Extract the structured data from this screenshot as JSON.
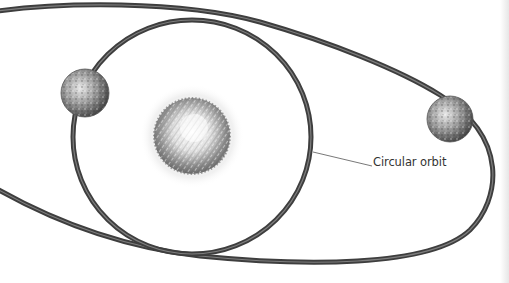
{
  "diagram": {
    "labels": {
      "circular_orbit": "Circular orbit"
    },
    "elements": [
      {
        "type": "star",
        "name": "central-star",
        "cx": 192,
        "cy": 136,
        "r": 38
      },
      {
        "type": "orbit",
        "name": "circular-orbit",
        "shape": "circle"
      },
      {
        "type": "orbit",
        "name": "elliptical-orbit",
        "shape": "ellipse"
      },
      {
        "type": "planet",
        "name": "planet-on-circular-orbit",
        "cx": 85,
        "cy": 93,
        "r": 23
      },
      {
        "type": "planet",
        "name": "planet-on-elliptical-orbit",
        "cx": 450,
        "cy": 119,
        "r": 23
      }
    ],
    "colors": {
      "orbit": "#444444",
      "orbit_highlight": "#9a9a9a",
      "planet": "#8a8a8a",
      "star": "#9a9a9a",
      "glow": "#ececec",
      "label": "#333333"
    }
  }
}
